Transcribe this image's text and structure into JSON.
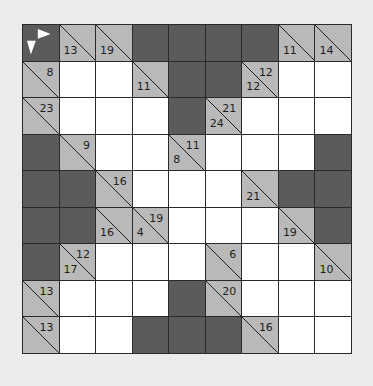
{
  "puzzle": {
    "type": "kakuro",
    "rows": 9,
    "cols": 9,
    "colors": {
      "background": "#ececec",
      "white_cell": "#ffffff",
      "dark_cell": "#5b5b5b",
      "clue_cell": "#b9b9b9",
      "grid_line": "#2a2a2a",
      "arrow": "#ffffff"
    },
    "corner_icon": "right-down-arrows-icon",
    "grid": [
      [
        {
          "t": "corner"
        },
        {
          "t": "clue",
          "down": "13"
        },
        {
          "t": "clue",
          "down": "19"
        },
        {
          "t": "dark"
        },
        {
          "t": "dark"
        },
        {
          "t": "dark"
        },
        {
          "t": "dark"
        },
        {
          "t": "clue",
          "down": "11"
        },
        {
          "t": "clue",
          "down": "14"
        }
      ],
      [
        {
          "t": "clue",
          "right": "8"
        },
        {
          "t": "white"
        },
        {
          "t": "white"
        },
        {
          "t": "clue",
          "down": "11"
        },
        {
          "t": "dark"
        },
        {
          "t": "dark"
        },
        {
          "t": "clue",
          "right": "12",
          "down": "12"
        },
        {
          "t": "white"
        },
        {
          "t": "white"
        }
      ],
      [
        {
          "t": "clue",
          "right": "23"
        },
        {
          "t": "white"
        },
        {
          "t": "white"
        },
        {
          "t": "white"
        },
        {
          "t": "dark"
        },
        {
          "t": "clue",
          "right": "21",
          "down": "24"
        },
        {
          "t": "white"
        },
        {
          "t": "white"
        },
        {
          "t": "white"
        }
      ],
      [
        {
          "t": "dark"
        },
        {
          "t": "clue",
          "right": "9"
        },
        {
          "t": "white"
        },
        {
          "t": "white"
        },
        {
          "t": "clue",
          "right": "11",
          "down": "8"
        },
        {
          "t": "white"
        },
        {
          "t": "white"
        },
        {
          "t": "white"
        },
        {
          "t": "dark"
        }
      ],
      [
        {
          "t": "dark"
        },
        {
          "t": "dark"
        },
        {
          "t": "clue",
          "right": "16"
        },
        {
          "t": "white"
        },
        {
          "t": "white"
        },
        {
          "t": "white"
        },
        {
          "t": "clue",
          "down": "21"
        },
        {
          "t": "dark"
        },
        {
          "t": "dark"
        }
      ],
      [
        {
          "t": "dark"
        },
        {
          "t": "dark"
        },
        {
          "t": "clue",
          "down": "16"
        },
        {
          "t": "clue",
          "right": "19",
          "down": "4"
        },
        {
          "t": "white"
        },
        {
          "t": "white"
        },
        {
          "t": "white"
        },
        {
          "t": "clue",
          "down": "19"
        },
        {
          "t": "dark"
        }
      ],
      [
        {
          "t": "dark"
        },
        {
          "t": "clue",
          "right": "12",
          "down": "17"
        },
        {
          "t": "white"
        },
        {
          "t": "white"
        },
        {
          "t": "white"
        },
        {
          "t": "clue",
          "right": "6"
        },
        {
          "t": "white"
        },
        {
          "t": "white"
        },
        {
          "t": "clue",
          "down": "10"
        }
      ],
      [
        {
          "t": "clue",
          "right": "13"
        },
        {
          "t": "white"
        },
        {
          "t": "white"
        },
        {
          "t": "white"
        },
        {
          "t": "dark"
        },
        {
          "t": "clue",
          "right": "20"
        },
        {
          "t": "white"
        },
        {
          "t": "white"
        },
        {
          "t": "white"
        }
      ],
      [
        {
          "t": "clue",
          "right": "13"
        },
        {
          "t": "white"
        },
        {
          "t": "white"
        },
        {
          "t": "dark"
        },
        {
          "t": "dark"
        },
        {
          "t": "dark"
        },
        {
          "t": "clue",
          "right": "16"
        },
        {
          "t": "white"
        },
        {
          "t": "white"
        }
      ]
    ]
  }
}
